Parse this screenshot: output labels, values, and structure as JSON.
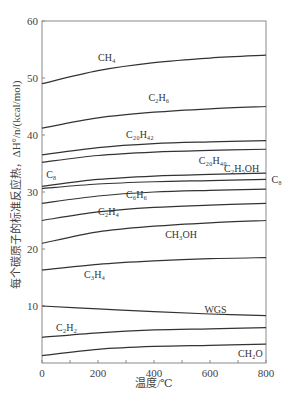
{
  "chart_data": {
    "type": "line",
    "title": "",
    "xlabel": "温度/℃",
    "ylabel": "每个碳原子的标准反应热，ΔH°/n/(kcal/mol)",
    "xlim": [
      0,
      800
    ],
    "ylim": [
      0,
      60
    ],
    "xticks": [
      0,
      200,
      400,
      600,
      800
    ],
    "yticks": [
      10,
      20,
      30,
      40,
      50,
      60
    ],
    "ytick_labels_shown": [
      "10",
      "20",
      "30",
      "40",
      "50",
      "60"
    ],
    "xtick_labels_shown": [
      "0",
      "200",
      "400",
      "600",
      "800"
    ],
    "grid": false,
    "legend": "inline labels",
    "x": [
      0,
      200,
      400,
      600,
      800
    ],
    "series": [
      {
        "name": "CH4",
        "label": "CH₄",
        "values": [
          49.0,
          51.3,
          52.7,
          53.5,
          54.0
        ]
      },
      {
        "name": "C2H6",
        "label": "C₂H₆",
        "values": [
          41.2,
          43.0,
          44.0,
          44.6,
          45.0
        ]
      },
      {
        "name": "C20H42",
        "label": "C₂₀H₄₂",
        "values": [
          36.5,
          37.8,
          38.5,
          38.8,
          39.0
        ]
      },
      {
        "name": "C20H40",
        "label": "C₂₀H₄₀",
        "values": [
          35.2,
          36.4,
          37.0,
          37.3,
          37.5
        ]
      },
      {
        "name": "C2H5OH",
        "label": "C₂H₅OH",
        "values": [
          31.0,
          32.2,
          32.8,
          33.1,
          33.3
        ]
      },
      {
        "name": "C8",
        "label": "C₈",
        "values": [
          30.6,
          31.4,
          31.8,
          32.0,
          32.2
        ]
      },
      {
        "name": "C6H6",
        "label": "C₆H₆",
        "values": [
          28.0,
          29.3,
          30.0,
          30.3,
          30.5
        ]
      },
      {
        "name": "C2H4",
        "label": "C₂H₄",
        "values": [
          25.0,
          26.5,
          27.3,
          27.7,
          28.0
        ]
      },
      {
        "name": "CH3OH",
        "label": "CH₃OH",
        "values": [
          21.0,
          23.0,
          24.0,
          24.6,
          25.0
        ]
      },
      {
        "name": "C3H4",
        "label": "C₃H₄",
        "values": [
          16.3,
          17.3,
          17.9,
          18.3,
          18.5
        ]
      },
      {
        "name": "WGS",
        "label": "WGS",
        "values": [
          10.0,
          9.5,
          9.0,
          8.6,
          8.3
        ]
      },
      {
        "name": "C2H2",
        "label": "C₂H₂",
        "values": [
          4.5,
          5.3,
          5.8,
          6.0,
          6.2
        ]
      },
      {
        "name": "CH2O",
        "label": "CH₂O",
        "values": [
          1.3,
          2.4,
          2.9,
          3.1,
          3.3
        ]
      }
    ],
    "annotations": [
      {
        "text": "CH₄",
        "x": 200,
        "y": 53
      },
      {
        "text": "C₂H₆",
        "x": 380,
        "y": 46
      },
      {
        "text": "C₂₀H₄₂",
        "x": 300,
        "y": 39.5
      },
      {
        "text": "C₈",
        "x": 15,
        "y": 32.5
      },
      {
        "text": "C₂₀H₄₀",
        "x": 560,
        "y": 35
      },
      {
        "text": "C₂H₅OH",
        "x": 650,
        "y": 33.5
      },
      {
        "text": "C₈",
        "x": 820,
        "y": 31.5
      },
      {
        "text": "C₆H₆",
        "x": 300,
        "y": 29
      },
      {
        "text": "C₂H₄",
        "x": 200,
        "y": 26
      },
      {
        "text": "CH₃OH",
        "x": 440,
        "y": 22
      },
      {
        "text": "C₃H₄",
        "x": 150,
        "y": 15
      },
      {
        "text": "WGS",
        "x": 580,
        "y": 8.8
      },
      {
        "text": "C₂H₂",
        "x": 50,
        "y": 5.7
      },
      {
        "text": "CH₂O",
        "x": 700,
        "y": 1
      }
    ]
  },
  "axes": {
    "x_title": "温度/℃",
    "y_title": "每个碳原子的标准反应热，ΔH°/n/(kcal/mol)",
    "x_ticks": [
      "0",
      "200",
      "400",
      "600",
      "800"
    ],
    "y_ticks": [
      "10",
      "20",
      "30",
      "40",
      "50",
      "60"
    ]
  },
  "colors": {
    "line": "#333333",
    "axis": "#888888",
    "text": "#444444"
  }
}
